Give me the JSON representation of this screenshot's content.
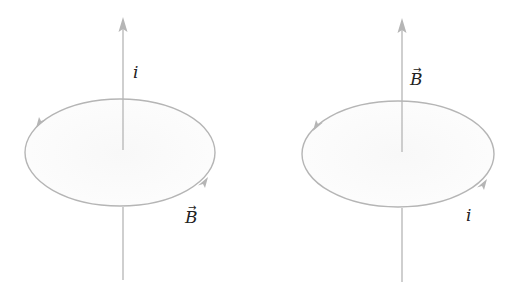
{
  "colors": {
    "line": "#b5b5b5",
    "fill": "#fbfbfb",
    "text": "#222222",
    "background": "#ffffff"
  },
  "panels": [
    {
      "id": "left",
      "description": "Current i along straight wire (upward), circular magnetic field B around wire",
      "axis_label": "i",
      "axis_label_is_vector": false,
      "loop_label": "B",
      "loop_label_is_vector": true,
      "loop_direction": "counterclockwise (viewed from top)"
    },
    {
      "id": "right",
      "description": "Current i in circular loop, magnetic field B along axis (upward)",
      "axis_label": "B",
      "axis_label_is_vector": true,
      "loop_label": "i",
      "loop_label_is_vector": false,
      "loop_direction": "counterclockwise (viewed from top)"
    }
  ],
  "vector_arrow_glyph": "→"
}
